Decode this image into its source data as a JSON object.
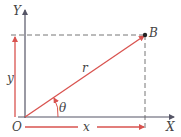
{
  "diagram": {
    "labels": {
      "x_axis": "X",
      "y_axis": "Y",
      "origin": "O",
      "point": "B",
      "radius": "r",
      "angle": "θ",
      "x_component": "x",
      "y_component": "y"
    },
    "colors": {
      "axis": "#555566",
      "accent": "#d9534f",
      "dash": "#666666",
      "text": "#444444"
    }
  }
}
